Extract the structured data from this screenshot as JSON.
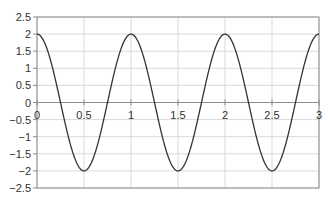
{
  "chart_data": {
    "type": "line",
    "title": "",
    "xlabel": "",
    "ylabel": "",
    "xlim": [
      0,
      3
    ],
    "ylim": [
      -2.5,
      2.5
    ],
    "grid": true,
    "legend": null,
    "x_ticks": [
      0,
      0.5,
      1,
      1.5,
      2,
      2.5,
      3
    ],
    "x_tick_labels": [
      "0",
      "0.5",
      "1",
      "1.5",
      "2",
      "2.5",
      "3"
    ],
    "y_ticks": [
      2.5,
      2,
      1.5,
      1,
      0.5,
      0,
      -0.5,
      -1,
      -1.5,
      -2,
      -2.5
    ],
    "y_tick_labels": [
      "2.5",
      "2",
      "1.5",
      "1",
      "0.5",
      "0",
      "-0.5",
      "-1",
      "-1.5",
      "-2",
      "-2.5"
    ],
    "series": [
      {
        "name": "y = 2cos(2πx)",
        "color": "#333333",
        "x": [
          0,
          0.25,
          0.5,
          0.75,
          1,
          1.25,
          1.5,
          1.75,
          2,
          2.25,
          2.5,
          2.75,
          3
        ],
        "values": [
          2,
          0,
          -2,
          0,
          2,
          0,
          -2,
          0,
          2,
          0,
          -2,
          0,
          2
        ]
      }
    ]
  },
  "colors": {
    "grid": "#d9d9d9",
    "axis": "#8c8c8c",
    "line": "#333333",
    "text": "#333333"
  }
}
